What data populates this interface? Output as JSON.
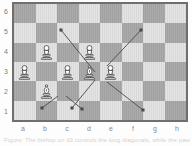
{
  "diagram": {
    "board": {
      "files": [
        "a",
        "b",
        "c",
        "d",
        "e",
        "f",
        "g",
        "h"
      ],
      "ranks": [
        "6",
        "5",
        "4",
        "3",
        "2",
        "1"
      ],
      "light_square_color": "#e3e3e3",
      "dark_square_color": "#a8a8a8",
      "border_color": "#6f6f6f",
      "columns": 8,
      "rows": 6
    },
    "pieces": [
      {
        "type": "pawn",
        "color": "white",
        "square": "b4",
        "file": 1,
        "rank": 2
      },
      {
        "type": "pawn",
        "color": "white",
        "square": "d4",
        "file": 3,
        "rank": 2
      },
      {
        "type": "pawn",
        "color": "white",
        "square": "a3",
        "file": 0,
        "rank": 3
      },
      {
        "type": "pawn",
        "color": "white",
        "square": "c3",
        "file": 2,
        "rank": 3
      },
      {
        "type": "bishop",
        "color": "white",
        "square": "d3",
        "file": 3,
        "rank": 3
      },
      {
        "type": "pawn",
        "color": "white",
        "square": "e3",
        "file": 4,
        "rank": 3
      },
      {
        "type": "bishop",
        "color": "white",
        "square": "b2",
        "file": 1,
        "rank": 4
      }
    ],
    "arrows": [
      {
        "from": "d3",
        "to": "b5",
        "x1": 81,
        "y1": 68,
        "x2": 47,
        "y2": 26
      },
      {
        "from": "d3",
        "to": "f5",
        "x1": 93,
        "y1": 62,
        "x2": 127,
        "y2": 26
      },
      {
        "from": "d3",
        "to": "b1",
        "x1": 81,
        "y1": 76,
        "x2": 58,
        "y2": 104
      },
      {
        "from": "d3",
        "to": "f1",
        "x1": 93,
        "y1": 78,
        "x2": 129,
        "y2": 106
      },
      {
        "from": "b2",
        "to": "a1",
        "x1": 44,
        "y1": 92,
        "x2": 28,
        "y2": 104
      },
      {
        "from": "b2",
        "to": "c1",
        "x1": 52,
        "y1": 92,
        "x2": 68,
        "y2": 105
      }
    ],
    "arrow_color": "#4a4a4a",
    "caption": "Figure: The bishop on d3 controls the long diagonals, while the pawns restrict its scope."
  }
}
